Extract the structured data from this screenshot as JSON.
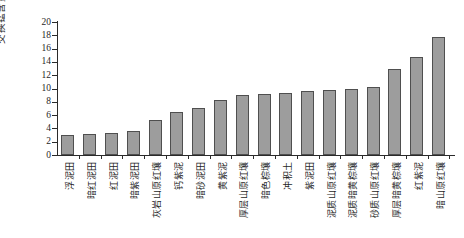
{
  "chart_data": {
    "type": "bar",
    "title": "",
    "xlabel": "",
    "ylabel": "交换锰含量/(mg/kg)",
    "ylim": [
      0,
      20
    ],
    "ytick_step": 2,
    "yticks": [
      0,
      2,
      4,
      6,
      8,
      10,
      12,
      14,
      16,
      18,
      20
    ],
    "grid": false,
    "legend_position": "none",
    "bar_fill": "#9d9d9d",
    "bar_border": "#4f4f4f",
    "axis_color": "#2a2a2a",
    "categories": [
      "浮泥田",
      "暗红泥田",
      "红泥田",
      "暗紫泥田",
      "灰岩山原红壤",
      "钙紫泥",
      "暗砂泥田",
      "黄紫泥",
      "厚层山原红壤",
      "暗色棕壤",
      "冲积土",
      "紫泥田",
      "泥质山原红壤",
      "泥质暗黄棕壤",
      "砂质山原红壤",
      "厚层暗黄棕壤",
      "红紫泥",
      "暗山原红壤"
    ],
    "values": [
      3.0,
      3.2,
      3.3,
      3.6,
      5.2,
      6.5,
      7.0,
      8.2,
      9.0,
      9.1,
      9.3,
      9.6,
      9.8,
      9.9,
      10.2,
      13.0,
      14.8,
      17.7
    ]
  }
}
